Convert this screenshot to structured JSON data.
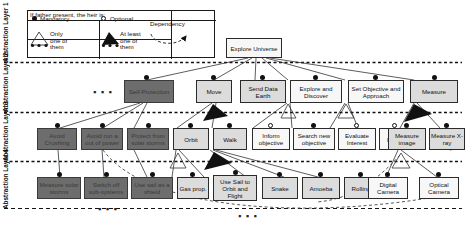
{
  "diagram": {
    "layers": [
      {
        "id": "l1",
        "label": "Abstraction Layer 1"
      },
      {
        "id": "l2",
        "label": "Abstraction Layer 2"
      },
      {
        "id": "l3",
        "label": "Abstraction Layer 3"
      },
      {
        "id": "l4",
        "label": "Abstraction Layer 4"
      }
    ],
    "legend": {
      "title": "If father present, the heir is:",
      "mandatory": "Mandatory",
      "optional": "Optional",
      "only_one": "Only one of them",
      "at_least_one": "At least one of them",
      "dependency": "Dependency"
    },
    "root": {
      "label": "Explore Universe"
    },
    "layer2_nodes": [
      {
        "label": "Self-Protection",
        "style": "dark"
      },
      {
        "label": "Move",
        "style": "grey"
      },
      {
        "label": "Send Data Earth",
        "style": "grey"
      },
      {
        "label": "Explore and Discover",
        "style": "white"
      },
      {
        "label": "Set Objective and Approach",
        "style": "white"
      },
      {
        "label": "Measure",
        "style": "grey"
      }
    ],
    "layer3_nodes": [
      {
        "label": "Avoid Crushing",
        "style": "dark"
      },
      {
        "label": "Avoid run a out of power",
        "style": "dark"
      },
      {
        "label": "Protect from solar storms",
        "style": "dark"
      },
      {
        "label": "Orbit",
        "style": "grey"
      },
      {
        "label": "Walk",
        "style": "grey"
      },
      {
        "label": "Inform objective",
        "style": "white"
      },
      {
        "label": "Search new objective",
        "style": "white"
      },
      {
        "label": "Evaluate Interest",
        "style": "white"
      },
      {
        "label": "Learn",
        "style": "white"
      },
      {
        "label": "Measure image",
        "style": "grey"
      },
      {
        "label": "Measure X-ray",
        "style": "grey"
      }
    ],
    "layer4_nodes": [
      {
        "label": "Measure solar storms",
        "style": "dark"
      },
      {
        "label": "Switch off sub-systems",
        "style": "dark"
      },
      {
        "label": "Use sail as a shield",
        "style": "dark"
      },
      {
        "label": "Gas prop.",
        "style": "grey"
      },
      {
        "label": "Use Sail to Orbit and Flight",
        "style": "grey"
      },
      {
        "label": "Snake",
        "style": "grey"
      },
      {
        "label": "Amoeba",
        "style": "grey"
      },
      {
        "label": "Rolling",
        "style": "grey"
      },
      {
        "label": "Digital Camera",
        "style": "white"
      },
      {
        "label": "Optical Camera",
        "style": "white"
      }
    ],
    "ellipsis": "▪ ▪ ▪"
  }
}
